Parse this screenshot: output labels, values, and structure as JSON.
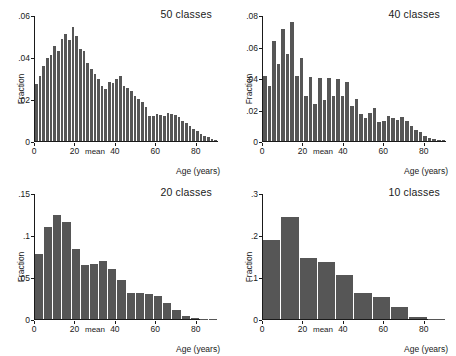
{
  "figure": {
    "background": "#ffffff",
    "bar_color": "#565656",
    "axis_color": "#1a1a1a"
  },
  "common": {
    "ylabel": "Fraction",
    "xlabel": "Age (years)",
    "mean_label": "mean"
  },
  "chart_data": [
    {
      "type": "bar",
      "title": "50 classes",
      "xlabel": "Age (years)",
      "ylabel": "Fraction",
      "xlim": [
        0,
        91
      ],
      "ylim": [
        0,
        0.06
      ],
      "xticks": [
        0,
        20,
        40,
        60,
        80
      ],
      "yticks": [
        0,
        0.02,
        0.04,
        0.06
      ],
      "ytick_labels": [
        "0",
        ".02",
        ".04",
        ".06"
      ],
      "xtick_labels": [
        "0",
        "20",
        "40",
        "60",
        "80"
      ],
      "grid": false,
      "legend": "none",
      "annotations": [
        "mean"
      ],
      "bin_width": 1.82,
      "x": [
        0.9,
        2.7,
        4.5,
        6.4,
        8.2,
        10.0,
        11.8,
        13.6,
        15.5,
        17.3,
        19.1,
        20.9,
        22.7,
        24.5,
        26.4,
        28.2,
        30.0,
        31.8,
        33.6,
        35.5,
        37.3,
        39.1,
        40.9,
        42.7,
        44.5,
        46.4,
        48.2,
        50.0,
        51.8,
        53.6,
        55.5,
        57.3,
        59.1,
        60.9,
        62.7,
        64.5,
        66.4,
        68.2,
        70.0,
        71.8,
        73.6,
        75.5,
        77.3,
        79.1,
        80.9,
        82.7,
        84.5,
        86.4,
        88.2,
        90.0
      ],
      "values": [
        0.0275,
        0.031,
        0.036,
        0.04,
        0.0415,
        0.0455,
        0.043,
        0.049,
        0.0515,
        0.0485,
        0.0545,
        0.0505,
        0.044,
        0.043,
        0.0375,
        0.0345,
        0.032,
        0.03,
        0.0262,
        0.025,
        0.0285,
        0.028,
        0.03,
        0.031,
        0.0265,
        0.0255,
        0.024,
        0.0215,
        0.02,
        0.0185,
        0.0165,
        0.012,
        0.012,
        0.013,
        0.0125,
        0.0122,
        0.0135,
        0.013,
        0.0125,
        0.0115,
        0.0098,
        0.0085,
        0.0072,
        0.006,
        0.0048,
        0.0036,
        0.0026,
        0.0018,
        0.001,
        0.0004
      ]
    },
    {
      "type": "bar",
      "title": "40 classes",
      "xlabel": "Age (years)",
      "ylabel": "Fraction",
      "xlim": [
        0,
        91
      ],
      "ylim": [
        0,
        0.08
      ],
      "xticks": [
        0,
        20,
        40,
        60,
        80
      ],
      "yticks": [
        0,
        0.02,
        0.04,
        0.06,
        0.08
      ],
      "ytick_labels": [
        "0",
        ".02",
        ".04",
        ".06",
        ".08"
      ],
      "xtick_labels": [
        "0",
        "20",
        "40",
        "60",
        "80"
      ],
      "grid": false,
      "legend": "none",
      "annotations": [
        "mean"
      ],
      "bin_width": 2.275,
      "x": [
        1.1,
        3.4,
        5.7,
        8.0,
        10.2,
        12.5,
        14.8,
        17.1,
        19.3,
        21.6,
        23.9,
        26.1,
        28.4,
        30.7,
        33.0,
        35.2,
        37.5,
        39.8,
        42.0,
        44.3,
        46.6,
        48.9,
        51.1,
        53.4,
        55.7,
        58.0,
        60.2,
        62.5,
        64.8,
        67.0,
        69.3,
        71.6,
        73.9,
        76.1,
        78.4,
        80.7,
        83.0,
        85.2,
        87.5,
        89.8
      ],
      "values": [
        0.0415,
        0.035,
        0.064,
        0.049,
        0.0715,
        0.0555,
        0.076,
        0.0415,
        0.053,
        0.0285,
        0.041,
        0.0235,
        0.0405,
        0.026,
        0.0405,
        0.029,
        0.04,
        0.0285,
        0.0378,
        0.0225,
        0.027,
        0.0175,
        0.015,
        0.018,
        0.021,
        0.012,
        0.0125,
        0.016,
        0.015,
        0.0135,
        0.0155,
        0.0125,
        0.0095,
        0.007,
        0.0058,
        0.003,
        0.0022,
        0.0015,
        0.0008,
        0.0004
      ]
    },
    {
      "type": "bar",
      "title": "20 classes",
      "xlabel": "Age (years)",
      "ylabel": "Fraction",
      "xlim": [
        0,
        91
      ],
      "ylim": [
        0,
        0.15
      ],
      "xticks": [
        0,
        20,
        40,
        60,
        80
      ],
      "yticks": [
        0,
        0.05,
        0.1,
        0.15
      ],
      "ytick_labels": [
        "0",
        ".05",
        ".1",
        ".15"
      ],
      "xtick_labels": [
        "0",
        "20",
        "40",
        "60",
        "80"
      ],
      "grid": false,
      "legend": "none",
      "annotations": [
        "mean"
      ],
      "bin_width": 4.55,
      "x": [
        2.3,
        6.8,
        11.4,
        15.9,
        20.5,
        25.0,
        29.5,
        34.1,
        38.6,
        43.2,
        47.7,
        52.3,
        56.8,
        61.4,
        65.9,
        70.5,
        75.0,
        79.5,
        84.1,
        88.6
      ],
      "values": [
        0.078,
        0.111,
        0.125,
        0.116,
        0.084,
        0.0645,
        0.066,
        0.0695,
        0.06,
        0.0465,
        0.031,
        0.031,
        0.0305,
        0.0275,
        0.019,
        0.0105,
        0.0042,
        0.0014,
        0.0005,
        0.0002
      ]
    },
    {
      "type": "bar",
      "title": "10 classes",
      "xlabel": "Age (years)",
      "ylabel": "Fraction",
      "xlim": [
        0,
        91
      ],
      "ylim": [
        0,
        0.3
      ],
      "xticks": [
        0,
        20,
        40,
        60,
        80
      ],
      "yticks": [
        0,
        0.1,
        0.2,
        0.3
      ],
      "ytick_labels": [
        "0",
        ".1",
        ".2",
        ".3"
      ],
      "xtick_labels": [
        "0",
        "20",
        "40",
        "60",
        "80"
      ],
      "grid": false,
      "legend": "none",
      "annotations": [
        "mean"
      ],
      "bin_width": 9.1,
      "x": [
        4.5,
        13.6,
        22.7,
        31.8,
        40.9,
        50.0,
        59.1,
        68.2,
        77.3,
        86.4
      ],
      "values": [
        0.19,
        0.245,
        0.147,
        0.138,
        0.105,
        0.062,
        0.054,
        0.028,
        0.005,
        0.0008
      ]
    }
  ]
}
